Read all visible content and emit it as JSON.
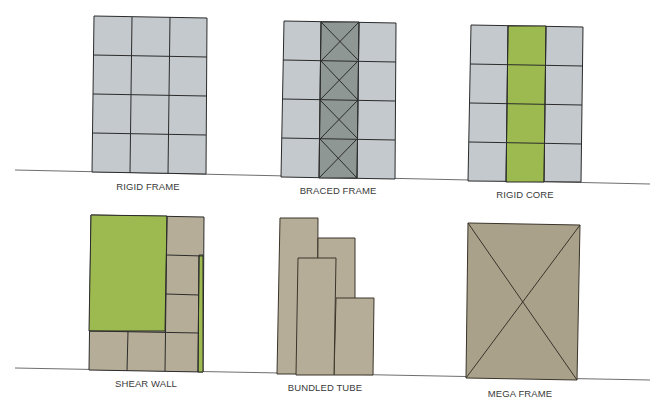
{
  "diagram": {
    "colors": {
      "steel_gray": "#c3c9cd",
      "brace_gray": "#8e9794",
      "core_green": "#9cba4f",
      "concrete_tan": "#b6ad98",
      "mega_tan": "#a9a18a",
      "line": "#2b2b2b",
      "ground": "#6e6e6e"
    },
    "systems": [
      {
        "id": "rigid-frame",
        "label": "RIGID FRAME"
      },
      {
        "id": "braced-frame",
        "label": "BRACED FRAME"
      },
      {
        "id": "rigid-core",
        "label": "RIGID CORE"
      },
      {
        "id": "shear-wall",
        "label": "SHEAR WALL"
      },
      {
        "id": "bundled-tube",
        "label": "BUNDLED TUBE"
      },
      {
        "id": "mega-frame",
        "label": "MEGA FRAME"
      }
    ]
  }
}
